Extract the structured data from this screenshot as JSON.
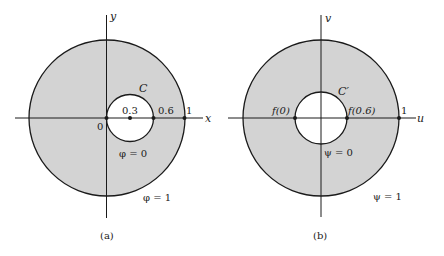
{
  "colors": {
    "shade": "#d3d3d3",
    "stroke": "#1a1a1a",
    "background": "#ffffff"
  },
  "panel_a": {
    "caption": "(a)",
    "x_axis_label": "x",
    "y_axis_label": "y",
    "curve_label": "C",
    "origin_label": "0",
    "point_labels": [
      "0.3",
      "0.6",
      "1"
    ],
    "inner_boundary_label": "φ = 0",
    "outer_boundary_label": "φ = 1"
  },
  "panel_b": {
    "caption": "(b)",
    "x_axis_label": "u",
    "y_axis_label": "v",
    "curve_label": "C′",
    "point_labels": [
      "f(0)",
      "f(0.6)",
      "1"
    ],
    "inner_boundary_label": "ψ = 0",
    "outer_boundary_label": "ψ = 1"
  }
}
